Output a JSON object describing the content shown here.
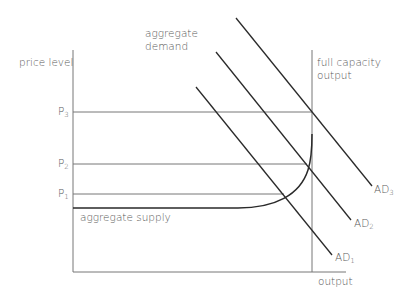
{
  "diagram": {
    "y_axis_label": "price level",
    "x_axis_label": "output",
    "full_capacity_label_line1": "full capacity",
    "full_capacity_label_line2": "output",
    "ad_group_label_line1": "aggregate",
    "ad_group_label_line2": "demand",
    "as_label": "aggregate supply",
    "price_levels": [
      {
        "base": "P",
        "sub": "3"
      },
      {
        "base": "P",
        "sub": "2"
      },
      {
        "base": "P",
        "sub": "1"
      }
    ],
    "ad_curves": [
      {
        "base": "AD",
        "sub": "3"
      },
      {
        "base": "AD",
        "sub": "2"
      },
      {
        "base": "AD",
        "sub": "1"
      }
    ],
    "colors": {
      "line": "#2a2a2a",
      "guide": "#777777",
      "text": "#5a5a5a"
    }
  }
}
